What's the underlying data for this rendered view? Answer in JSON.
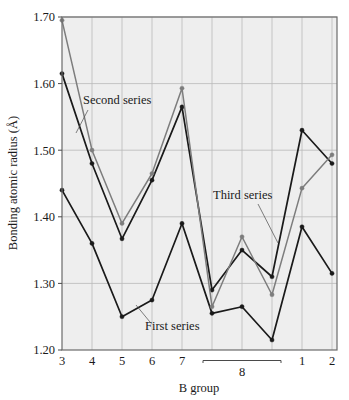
{
  "chart_data": {
    "type": "line",
    "title": "",
    "xlabel": "B group",
    "ylabel": "Bonding atomic radius (Å)",
    "xlim": [
      0,
      9
    ],
    "ylim": [
      1.2,
      1.7
    ],
    "grid": true,
    "legend_position": "inline-annotations",
    "categories": [
      "3",
      "4",
      "5",
      "6",
      "7",
      "8",
      "8",
      "8",
      "1",
      "2"
    ],
    "tick_labels": [
      "3",
      "4",
      "5",
      "6",
      "7",
      "",
      "",
      "",
      "1",
      "2"
    ],
    "group_bracket": {
      "label": "8",
      "spans_indices": [
        5,
        6,
        7
      ]
    },
    "y_ticks": [
      "1.20",
      "1.30",
      "1.40",
      "1.50",
      "1.60",
      "1.70"
    ],
    "y_tick_values": [
      1.2,
      1.3,
      1.4,
      1.5,
      1.6,
      1.7
    ],
    "series": [
      {
        "name": "First series",
        "color": "#1a1a1a",
        "values": [
          1.44,
          1.36,
          1.25,
          1.275,
          1.39,
          1.255,
          1.265,
          1.215,
          1.385,
          1.315
        ]
      },
      {
        "name": "Second series",
        "color": "#1a1a1a",
        "values": [
          1.615,
          1.48,
          1.367,
          1.455,
          1.565,
          1.29,
          1.35,
          1.31,
          1.53,
          1.48
        ]
      },
      {
        "name": "Third series",
        "color": "#7d7d7d",
        "values": [
          1.695,
          1.5,
          1.39,
          1.465,
          1.593,
          1.265,
          1.37,
          1.283,
          1.443,
          1.493
        ]
      }
    ],
    "annotations": [
      {
        "text": "Second series",
        "x": 83,
        "y": 104,
        "leader_from": [
          88,
          110
        ],
        "leader_to": [
          76,
          133
        ]
      },
      {
        "text": "First series",
        "x": 145,
        "y": 330,
        "leader_from": [
          150,
          322
        ],
        "leader_to": [
          136,
          305
        ]
      },
      {
        "text": "Third series",
        "x": 213,
        "y": 199,
        "leader_from": [
          258,
          204
        ],
        "leader_to": [
          278,
          243
        ]
      }
    ]
  },
  "style": {
    "plot_background": "#eeeeee",
    "grid_color": "#b9b9b9",
    "frame_color": "#6b6b6b",
    "page_background": "#ffffff"
  }
}
